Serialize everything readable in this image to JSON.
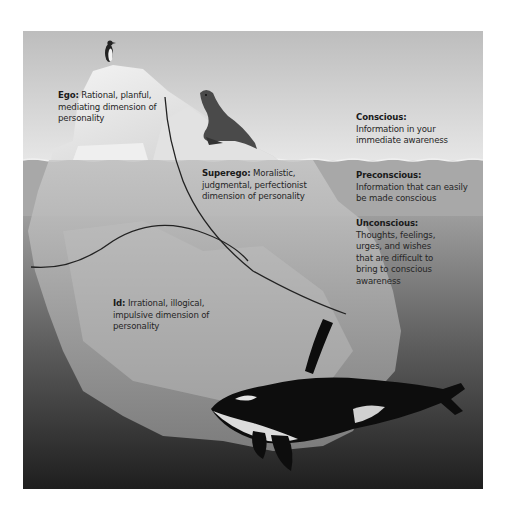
{
  "diagram": {
    "colors": {
      "sky": "#c9c9c9",
      "above_water_band": "#d9d9d9",
      "preconscious_band": "#a9a9a9",
      "unconscious_top": "#9a9a9a",
      "unconscious_bottom": "#2a2a2a",
      "iceberg": "#e8e8e8",
      "text": "#262626",
      "divider_line": "#222222",
      "orca_black": "#0d0d0d",
      "orca_white": "#dcdcdc"
    },
    "structures": {
      "ego": {
        "name": "Ego:",
        "description": "Rational, planful, mediating dimension of personality"
      },
      "superego": {
        "name": "Superego:",
        "description": "Moralistic, judgmental, perfectionist dimension of personality"
      },
      "id": {
        "name": "Id:",
        "description": "Irrational, illogical, impulsive dimension of personality"
      }
    },
    "levels": {
      "conscious": {
        "name": "Conscious:",
        "description": "Information in your immediate awareness"
      },
      "preconscious": {
        "name": "Preconscious:",
        "description": "Information that can easily be made conscious"
      },
      "unconscious": {
        "name": "Unconscious:",
        "description": "Thoughts, feelings, urges, and wishes that are difficult to bring to conscious awareness"
      }
    },
    "illustrations": [
      "penguin-icon",
      "seal-icon",
      "iceberg",
      "orca-icon"
    ]
  }
}
